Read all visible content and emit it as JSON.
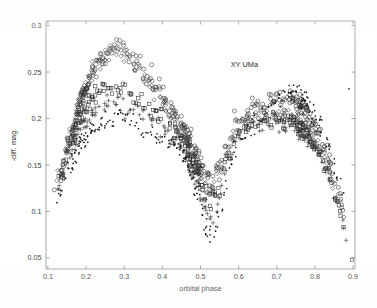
{
  "figure": {
    "annotation": "XY UMa",
    "background_color": "#ffffff",
    "axis_color": "#8b8b8b",
    "marker_color": "#2e2e2e"
  },
  "chart_data": {
    "type": "scatter",
    "title": "",
    "annotation": "XY UMa",
    "annotation_x": 0.615,
    "annotation_y": 0.256,
    "xlabel": "orbital phase",
    "ylabel": "-diff. mag.",
    "xlim": [
      0.095,
      0.905
    ],
    "ylim": [
      0.038,
      0.305
    ],
    "xticks": [
      0.1,
      0.2,
      0.3,
      0.4,
      0.5,
      0.6,
      0.7,
      0.8,
      0.9
    ],
    "xticklabels": [
      "0.1",
      "0.2",
      "0.3",
      "0.4",
      "0.5",
      "0.6",
      "0.7",
      "0.8",
      "0.9"
    ],
    "yticks": [
      0.05,
      0.1,
      0.15,
      0.2,
      0.25,
      0.3
    ],
    "yticklabels": [
      "0.05",
      "0.1",
      "0.15",
      "0.2",
      "0.25",
      "0.3"
    ],
    "grid": false,
    "legend": "none",
    "marker_styles": [
      "circle",
      "diamond",
      "square",
      "plus",
      "dot"
    ],
    "series": [
      {
        "name": "season-circles",
        "marker": "circle",
        "knots_x": [
          0.1,
          0.13,
          0.16,
          0.19,
          0.22,
          0.25,
          0.28,
          0.3,
          0.33,
          0.36,
          0.39,
          0.42,
          0.45,
          0.47,
          0.49,
          0.51,
          0.53,
          0.55,
          0.57,
          0.59,
          0.62,
          0.65,
          0.68,
          0.71,
          0.74,
          0.77,
          0.8,
          0.83,
          0.86,
          0.89
        ],
        "knots_y": [
          0.098,
          0.135,
          0.178,
          0.225,
          0.252,
          0.268,
          0.277,
          0.275,
          0.262,
          0.248,
          0.232,
          0.214,
          0.192,
          0.178,
          0.16,
          0.14,
          0.132,
          0.146,
          0.17,
          0.192,
          0.208,
          0.214,
          0.218,
          0.221,
          0.219,
          0.21,
          0.192,
          0.162,
          0.122,
          0.075
        ],
        "scatter": 0.011,
        "n_points": 300
      },
      {
        "name": "season-diamonds",
        "marker": "diamond",
        "knots_x": [
          0.1,
          0.13,
          0.16,
          0.19,
          0.22,
          0.25,
          0.28,
          0.3,
          0.33,
          0.36,
          0.39,
          0.42,
          0.45,
          0.47,
          0.49,
          0.51,
          0.53,
          0.55,
          0.57,
          0.59,
          0.62,
          0.65,
          0.68,
          0.71,
          0.74,
          0.77,
          0.8,
          0.83,
          0.86,
          0.89
        ],
        "knots_y": [
          0.102,
          0.142,
          0.186,
          0.228,
          0.252,
          0.266,
          0.275,
          0.272,
          0.255,
          0.238,
          0.222,
          0.206,
          0.188,
          0.172,
          0.152,
          0.13,
          0.124,
          0.14,
          0.166,
          0.188,
          0.2,
          0.204,
          0.206,
          0.206,
          0.202,
          0.194,
          0.178,
          0.152,
          0.115,
          0.072
        ],
        "scatter": 0.01,
        "n_points": 260
      },
      {
        "name": "season-squares",
        "marker": "square",
        "knots_x": [
          0.1,
          0.13,
          0.16,
          0.19,
          0.22,
          0.25,
          0.28,
          0.3,
          0.33,
          0.36,
          0.39,
          0.42,
          0.45,
          0.47,
          0.49,
          0.51,
          0.53,
          0.55,
          0.57,
          0.59,
          0.62,
          0.65,
          0.68,
          0.71,
          0.74,
          0.77,
          0.8,
          0.83,
          0.86,
          0.89
        ],
        "knots_y": [
          0.096,
          0.134,
          0.176,
          0.208,
          0.224,
          0.231,
          0.234,
          0.232,
          0.224,
          0.214,
          0.204,
          0.194,
          0.18,
          0.166,
          0.146,
          0.122,
          0.112,
          0.128,
          0.156,
          0.18,
          0.192,
          0.196,
          0.198,
          0.198,
          0.195,
          0.188,
          0.172,
          0.146,
          0.11,
          0.066
        ],
        "scatter": 0.01,
        "n_points": 240
      },
      {
        "name": "season-plus",
        "marker": "plus",
        "knots_x": [
          0.1,
          0.13,
          0.16,
          0.19,
          0.22,
          0.25,
          0.28,
          0.3,
          0.33,
          0.36,
          0.39,
          0.42,
          0.45,
          0.47,
          0.49,
          0.51,
          0.53,
          0.55,
          0.57,
          0.59,
          0.62,
          0.65,
          0.68,
          0.71,
          0.74,
          0.77,
          0.8,
          0.83,
          0.86,
          0.89
        ],
        "knots_y": [
          0.092,
          0.128,
          0.166,
          0.194,
          0.208,
          0.214,
          0.216,
          0.214,
          0.208,
          0.2,
          0.192,
          0.184,
          0.172,
          0.158,
          0.136,
          0.108,
          0.094,
          0.112,
          0.146,
          0.174,
          0.188,
          0.192,
          0.195,
          0.196,
          0.194,
          0.186,
          0.17,
          0.144,
          0.108,
          0.064
        ],
        "scatter": 0.011,
        "n_points": 200
      },
      {
        "name": "season-dots",
        "marker": "dot",
        "knots_x": [
          0.1,
          0.13,
          0.16,
          0.19,
          0.22,
          0.25,
          0.28,
          0.3,
          0.33,
          0.36,
          0.39,
          0.42,
          0.45,
          0.47,
          0.49,
          0.51,
          0.53,
          0.55,
          0.57,
          0.59,
          0.62,
          0.65,
          0.68,
          0.71,
          0.74,
          0.77,
          0.8,
          0.83,
          0.86,
          0.89
        ],
        "knots_y": [
          0.088,
          0.12,
          0.152,
          0.176,
          0.19,
          0.198,
          0.202,
          0.2,
          0.194,
          0.186,
          0.18,
          0.174,
          0.164,
          0.15,
          0.124,
          0.092,
          0.072,
          0.092,
          0.134,
          0.168,
          0.19,
          0.2,
          0.21,
          0.222,
          0.228,
          0.222,
          0.204,
          0.176,
          0.138,
          0.09
        ],
        "scatter": 0.013,
        "n_points": 320
      }
    ],
    "outliers": [
      {
        "x": 0.372,
        "y": 0.258,
        "marker": "circle"
      },
      {
        "x": 0.897,
        "y": 0.048,
        "marker": "square"
      },
      {
        "x": 0.889,
        "y": 0.232,
        "marker": "dot"
      },
      {
        "x": 0.636,
        "y": 0.222,
        "marker": "circle"
      }
    ]
  }
}
